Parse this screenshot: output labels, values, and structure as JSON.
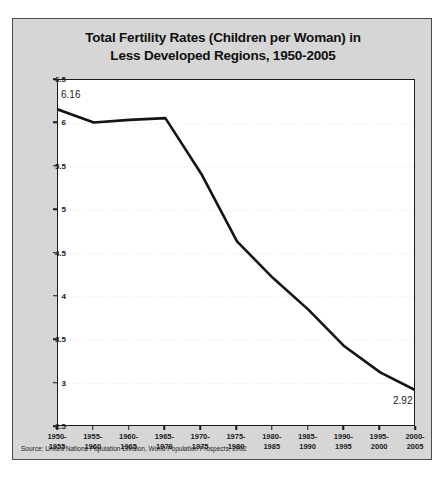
{
  "figure": {
    "title_lines": [
      "Total Fertility Rates (Children per Woman) in",
      "Less Developed Regions, 1950-2005"
    ],
    "source": "Source: United Nations Population Division, World Population Prospects, 2002"
  },
  "chart_data": {
    "type": "line",
    "title": "Total Fertility Rates (Children per Woman) in Less Developed Regions, 1950-2005",
    "xlabel": "",
    "ylabel": "TFR (Children per Woman)",
    "categories": [
      "1950-\n1955",
      "1955-\n1960",
      "1960-\n1965",
      "1965-\n1970",
      "1970-\n1975",
      "1975-\n1980",
      "1980-\n1985",
      "1985-\n1990",
      "1990-\n1995",
      "1995-\n2000",
      "2000-\n2005"
    ],
    "category_labels": [
      [
        "1950-",
        "1955"
      ],
      [
        "1955-",
        "1960"
      ],
      [
        "1960-",
        "1965"
      ],
      [
        "1965-",
        "1970"
      ],
      [
        "1970-",
        "1975"
      ],
      [
        "1975-",
        "1980"
      ],
      [
        "1980-",
        "1985"
      ],
      [
        "1985-",
        "1990"
      ],
      [
        "1990-",
        "1995"
      ],
      [
        "1995-",
        "2000"
      ],
      [
        "2000-",
        "2005"
      ]
    ],
    "values": [
      6.16,
      6.01,
      6.04,
      6.06,
      5.42,
      4.64,
      4.22,
      3.85,
      3.43,
      3.13,
      2.92
    ],
    "ylim": [
      2.5,
      6.5
    ],
    "yticks": [
      2.5,
      3,
      3.5,
      4,
      4.5,
      5,
      5.5,
      6,
      6.5
    ],
    "ytick_labels": [
      "2.5",
      "3",
      "3.5",
      "4",
      "4.5",
      "5",
      "5.5",
      "6",
      "6.5"
    ],
    "grid": true,
    "legend": false,
    "line_color": "#141414",
    "line_width": 2.6,
    "annotations": [
      {
        "label": "6.16",
        "point_index": 0,
        "position": "above-right"
      },
      {
        "label": "2.92",
        "point_index": 10,
        "position": "below-left"
      }
    ]
  },
  "colors": {
    "figure_background": "#d6d6d6",
    "plot_background": "#ffffff",
    "axis": "#1a1a1a",
    "grid": "#e9e9e9",
    "line": "#141414",
    "text": "#101010"
  }
}
